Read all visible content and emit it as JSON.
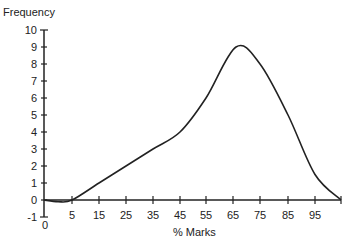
{
  "chart_data": {
    "type": "line",
    "title": "",
    "xlabel": "% Marks",
    "ylabel": "Frequency",
    "x_tick_labels": [
      "0",
      "5",
      "15",
      "25",
      "35",
      "45",
      "55",
      "65",
      "75",
      "85",
      "95"
    ],
    "y_tick_labels": [
      "-1",
      "0",
      "1",
      "2",
      "3",
      "4",
      "5",
      "6",
      "7",
      "8",
      "9",
      "10"
    ],
    "ylim": [
      -1,
      10
    ],
    "xlim": [
      0,
      100
    ],
    "grid": false,
    "legend": null,
    "series": [
      {
        "name": "Frequency",
        "smooth": true,
        "x": [
          0,
          2.5,
          5,
          15,
          25,
          35,
          45,
          55,
          65,
          75,
          85,
          95,
          100
        ],
        "values": [
          0,
          -0.1,
          0,
          1,
          2,
          3,
          4,
          6,
          9,
          8,
          5,
          1.5,
          0
        ]
      }
    ]
  },
  "layout": {
    "y_zero_px": 200,
    "y_unit_px": 17,
    "axis_x_px": 44,
    "x_tick_px": [
      44,
      72,
      99,
      126,
      153,
      180,
      206,
      233,
      260,
      288,
      315
    ],
    "x_end_px": 341,
    "curve_px_x": [
      44,
      58,
      72,
      99,
      126,
      153,
      180,
      206,
      236,
      260,
      288,
      315,
      341
    ],
    "line_color": "#222222"
  }
}
